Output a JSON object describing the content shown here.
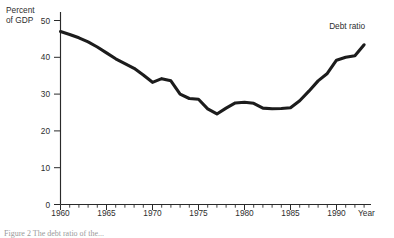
{
  "figure": {
    "caption_fragment": "Figure 2  The debt ratio of the..."
  },
  "chart_data": {
    "type": "line",
    "title": "",
    "xlabel": "Year",
    "ylabel": "Percent of GDP",
    "ylabel_line1": "Percent",
    "ylabel_line2": "of GDP",
    "xlim": [
      1960,
      1993
    ],
    "ylim": [
      0,
      52
    ],
    "grid": false,
    "legend_position": "inline-right",
    "y_ticks": [
      0,
      10,
      20,
      30,
      40,
      50
    ],
    "y_tick_labels": [
      "0",
      "10",
      "20",
      "30",
      "40",
      "50"
    ],
    "x_ticks": [
      1960,
      1965,
      1970,
      1975,
      1980,
      1985,
      1990
    ],
    "x_tick_labels": [
      "1960",
      "1965",
      "1970",
      "1975",
      "1980",
      "1985",
      "1990"
    ],
    "x_minor_tick_step": 1,
    "series": [
      {
        "name": "Debt ratio",
        "label": "Debt ratio",
        "color": "#1c1c1c",
        "x": [
          1960,
          1961,
          1962,
          1963,
          1964,
          1965,
          1966,
          1967,
          1968,
          1969,
          1970,
          1971,
          1972,
          1973,
          1974,
          1975,
          1976,
          1977,
          1978,
          1979,
          1980,
          1981,
          1982,
          1983,
          1984,
          1985,
          1986,
          1987,
          1988,
          1989,
          1990,
          1991,
          1992,
          1993
        ],
        "values": [
          47.0,
          46.2,
          45.3,
          44.2,
          42.8,
          41.2,
          39.6,
          38.3,
          37.0,
          35.2,
          33.2,
          34.2,
          33.6,
          30.0,
          28.8,
          28.6,
          26.0,
          24.6,
          26.2,
          27.6,
          27.8,
          27.5,
          26.2,
          26.0,
          26.1,
          26.3,
          28.2,
          30.8,
          33.6,
          35.6,
          39.2,
          40.0,
          40.4,
          43.4
        ]
      }
    ],
    "annotations": [
      {
        "text": "Debt ratio",
        "x": 1989.2,
        "y": 47.6,
        "name": "series-inline-label"
      }
    ]
  }
}
